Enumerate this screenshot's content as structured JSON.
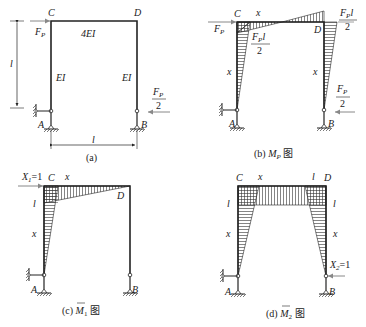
{
  "panels": {
    "a": {
      "caption": "(a)",
      "nodes": {
        "C": "C",
        "D": "D",
        "A": "A",
        "B": "B"
      },
      "beam_stiffness": "4EI",
      "column_stiffness_left": "EI",
      "column_stiffness_right": "EI",
      "load_left": "F",
      "load_left_sub": "P",
      "load_right_num": "F",
      "load_right_sub": "P",
      "load_right_den": "2",
      "height_dim": "l",
      "span_dim": "l"
    },
    "b": {
      "caption_prefix": "(b) ",
      "caption_M": "M",
      "caption_sub": "P",
      "caption_suffix": " 图",
      "nodes": {
        "C": "C",
        "D": "D",
        "A": "A",
        "B": "B"
      },
      "load_left": "F",
      "load_left_sub": "P",
      "moment_C_num": "F",
      "moment_C_sub": "P",
      "moment_C_l": "l",
      "moment_C_den": "2",
      "moment_D_num": "F",
      "moment_D_sub": "P",
      "moment_D_l": "l",
      "moment_D_den": "2",
      "load_right_num": "F",
      "load_right_sub": "P",
      "load_right_den": "2",
      "coord_beam": "x",
      "coord_left_col": "x",
      "coord_right_col": "x"
    },
    "c": {
      "caption_prefix": "(c) ",
      "caption_M": "M",
      "caption_sub": "1",
      "caption_suffix": " 图",
      "nodes": {
        "C": "C",
        "D": "D",
        "A": "A",
        "B": "B"
      },
      "unit_load": "X",
      "unit_load_sub": "1",
      "unit_load_val": "=1",
      "moment_C": "l",
      "coord_beam": "x",
      "coord_left_col": "x"
    },
    "d": {
      "caption_prefix": "(d) ",
      "caption_M": "M",
      "caption_sub": "2",
      "caption_suffix": " 图",
      "nodes": {
        "C": "C",
        "D": "D",
        "A": "A",
        "B": "B"
      },
      "unit_load": "X",
      "unit_load_sub": "2",
      "unit_load_val": "=1",
      "moment_C": "l",
      "moment_D": "l",
      "moment_D_top": "l",
      "coord_beam": "x",
      "coord_left_col": "x",
      "coord_right_col": "x"
    }
  },
  "colors": {
    "line": "#222222",
    "hatch": "#333333",
    "arrow": "#888888"
  }
}
